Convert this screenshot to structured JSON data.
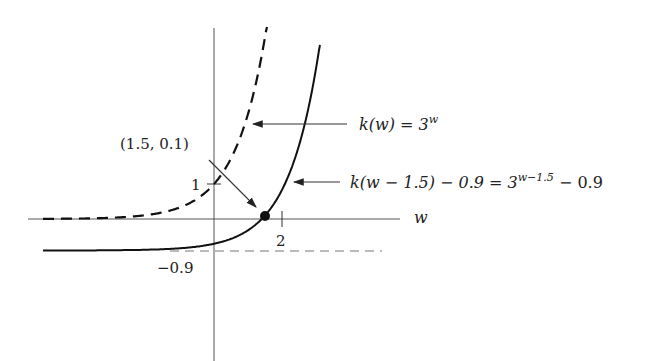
{
  "chart_data": {
    "type": "line",
    "title": "",
    "xlabel": "w",
    "ylabel": "",
    "grid": false,
    "axis_ranges": {
      "x": [
        -5,
        6.3
      ],
      "y": [
        -3.9,
        5.5
      ]
    },
    "series": [
      {
        "name": "k(w) = 3^w",
        "style": "dashed",
        "function": "3^w",
        "asymptote": 0
      },
      {
        "name": "k(w − 1.5) − 0.9 = 3^(w−1.5) − 0.9",
        "style": "solid",
        "function": "3^(w-1.5) - 0.9",
        "asymptote": -0.9
      }
    ],
    "ticks": {
      "x": [
        {
          "value": 2,
          "label": "2"
        }
      ],
      "y": [
        {
          "value": 1,
          "label": "1"
        },
        {
          "value": -0.9,
          "label": "−0.9"
        }
      ]
    },
    "points": [
      {
        "x": 1.5,
        "y": 0.1,
        "label": "(1.5, 0.1)"
      }
    ],
    "annotations": [
      {
        "text": "k(w) = 3^w",
        "points_to": "dashed curve"
      },
      {
        "text": "k(w − 1.5) − 0.9 = 3^(w−1.5) − 0.9",
        "points_to": "solid curve"
      },
      {
        "text": "(1.5, 0.1)",
        "points_to": "point (1.5, 0.1)"
      }
    ]
  },
  "labels": {
    "axis_w": "w",
    "tick_x_2": "2",
    "tick_y_1": "1",
    "tick_y_neg": "−0.9",
    "point_label": "(1.5, 0.1)",
    "curve1_lhs": "k(w) = 3",
    "curve1_exp": "w",
    "curve2_lhs": "k(w − 1.5) − 0.9 = 3",
    "curve2_exp": "w−1.5",
    "curve2_tail": " − 0.9"
  }
}
